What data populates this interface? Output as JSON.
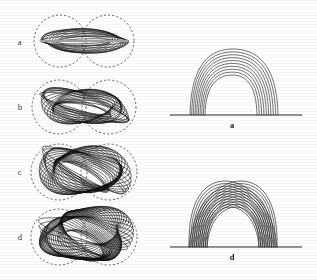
{
  "figure": {
    "background_color": "#fdfdfc",
    "ink_color": "#111111",
    "dash_color": "#4a4a4a",
    "width": 317,
    "height": 280,
    "caption_style": "lowercase-italic-serif"
  },
  "left_column": {
    "description": "Top-down projections of twisted flux rope field lines bounded by dashed bi-lobe separatrix outlines",
    "panels": [
      {
        "id": "panel-a",
        "label": "a",
        "label_x": 18,
        "label_y": 45,
        "center_x": 84,
        "center_y": 41,
        "lobe_radius": 26,
        "lobe_offset": 24,
        "bundle": {
          "n_lines": 13,
          "semi_major": 44,
          "semi_minor": 11,
          "tilt_deg": 0,
          "twist": 0.12,
          "spread": 0.95,
          "midline": true
        }
      },
      {
        "id": "panel-b",
        "label": "b",
        "label_x": 18,
        "label_y": 110,
        "center_x": 84,
        "center_y": 107,
        "lobe_radius": 27,
        "lobe_offset": 25,
        "bundle": {
          "n_lines": 22,
          "semi_major": 45,
          "semi_minor": 14,
          "tilt_deg": 4,
          "twist": 0.45,
          "spread": 1.0,
          "midline": false
        }
      },
      {
        "id": "panel-c",
        "label": "c",
        "label_x": 18,
        "label_y": 175,
        "center_x": 84,
        "center_y": 172,
        "lobe_radius": 28,
        "lobe_offset": 25,
        "bundle": {
          "n_lines": 30,
          "semi_major": 45,
          "semi_minor": 18,
          "tilt_deg": 9,
          "twist": 0.72,
          "spread": 1.05,
          "midline": false
        }
      },
      {
        "id": "panel-d",
        "label": "d",
        "label_x": 18,
        "label_y": 240,
        "center_x": 84,
        "center_y": 237,
        "lobe_radius": 28,
        "lobe_offset": 25,
        "bundle": {
          "n_lines": 38,
          "semi_major": 44,
          "semi_minor": 20,
          "tilt_deg": 13,
          "twist": 1.0,
          "spread": 1.05,
          "midline": false
        }
      }
    ]
  },
  "right_column": {
    "description": "Side elevation views of the same flux rope structures resting on a photospheric baseline",
    "panels": [
      {
        "id": "panel-right-a",
        "label": "a",
        "label_x": 232,
        "label_y": 128,
        "baseline": {
          "x1": 170,
          "x2": 302,
          "y": 115
        },
        "structure": {
          "type": "nested-arches",
          "n_arches": 10,
          "apex_y": 47,
          "foot_left": 200,
          "foot_right": 265,
          "half_width_min": 26,
          "half_width_max": 44,
          "height_min": 40,
          "height_max": 66,
          "crossing": false
        }
      },
      {
        "id": "panel-right-d",
        "label": "d",
        "label_x": 232,
        "label_y": 260,
        "baseline": {
          "x1": 170,
          "x2": 302,
          "y": 247
        },
        "structure": {
          "type": "woven-dome",
          "n_arches": 22,
          "apex_y": 180,
          "foot_left": 201,
          "foot_right": 265,
          "half_width_min": 26,
          "half_width_max": 44,
          "height_min": 40,
          "height_max": 66,
          "crossing": true,
          "skew_deg": 16
        }
      }
    ]
  }
}
